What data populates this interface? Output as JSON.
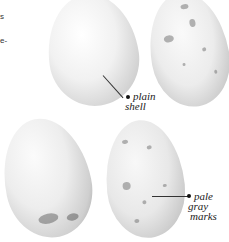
{
  "margin_fragments": [
    "s",
    "e-"
  ],
  "eggs": [
    {
      "id": "egg-1",
      "description": "plain white egg, top left"
    },
    {
      "id": "egg-2",
      "description": "speckled egg, top right"
    },
    {
      "id": "egg-3",
      "description": "white egg with dark base markings, bottom left"
    },
    {
      "id": "egg-4",
      "description": "egg with pale gray marks, bottom right"
    }
  ],
  "annotations": {
    "plain_shell": {
      "line1": "plain",
      "line2": "shell"
    },
    "pale_gray_marks": {
      "line1": "pale",
      "line2": "gray",
      "line3": "marks"
    }
  },
  "colors": {
    "background": "#ffffff",
    "egg_light": "#f4f4f4",
    "egg_shadow": "#9a9a9a",
    "speck": "#7a7a7a",
    "text": "#222222"
  }
}
